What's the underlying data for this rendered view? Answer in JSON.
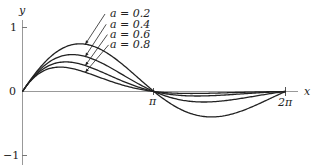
{
  "chart_data": {
    "type": "line",
    "title": "",
    "function": "y = e^(-a x) sin x",
    "xlabel": "x",
    "ylabel": "y",
    "xlim": [
      0,
      6.35
    ],
    "ylim": [
      -1,
      1
    ],
    "x_ticks": [
      {
        "value": 3.14159,
        "label": "π"
      },
      {
        "value": 6.28318,
        "label": "2π"
      }
    ],
    "y_ticks": [
      {
        "value": 1,
        "label": "1"
      },
      {
        "value": 0,
        "label": "0"
      },
      {
        "value": -1,
        "label": "−1"
      }
    ],
    "grid": false,
    "series": [
      {
        "name": "a = 0.2",
        "a": 0.2,
        "peak": [
          1.37,
          0.75
        ],
        "trough": [
          4.51,
          -0.4
        ]
      },
      {
        "name": "a = 0.4",
        "a": 0.4,
        "peak": [
          1.19,
          0.58
        ],
        "trough": [
          4.33,
          -0.17
        ]
      },
      {
        "name": "a = 0.6",
        "a": 0.6,
        "peak": [
          1.03,
          0.46
        ],
        "trough": [
          4.17,
          -0.07
        ]
      },
      {
        "name": "a = 0.8",
        "a": 0.8,
        "peak": [
          0.9,
          0.38
        ],
        "trough": [
          4.04,
          -0.03
        ]
      }
    ],
    "legend": [
      "a = 0.2",
      "a = 0.4",
      "a = 0.6",
      "a = 0.8"
    ]
  },
  "labels": {
    "x": "x",
    "y": "y",
    "pi": "π",
    "two_pi": "2π",
    "one": "1",
    "zero": "0",
    "neg_one": "−1",
    "series": [
      "a = 0.2",
      "a = 0.4",
      "a = 0.6",
      "a = 0.8"
    ]
  },
  "colors": {
    "curve": "#222222",
    "axis": "#888888"
  }
}
